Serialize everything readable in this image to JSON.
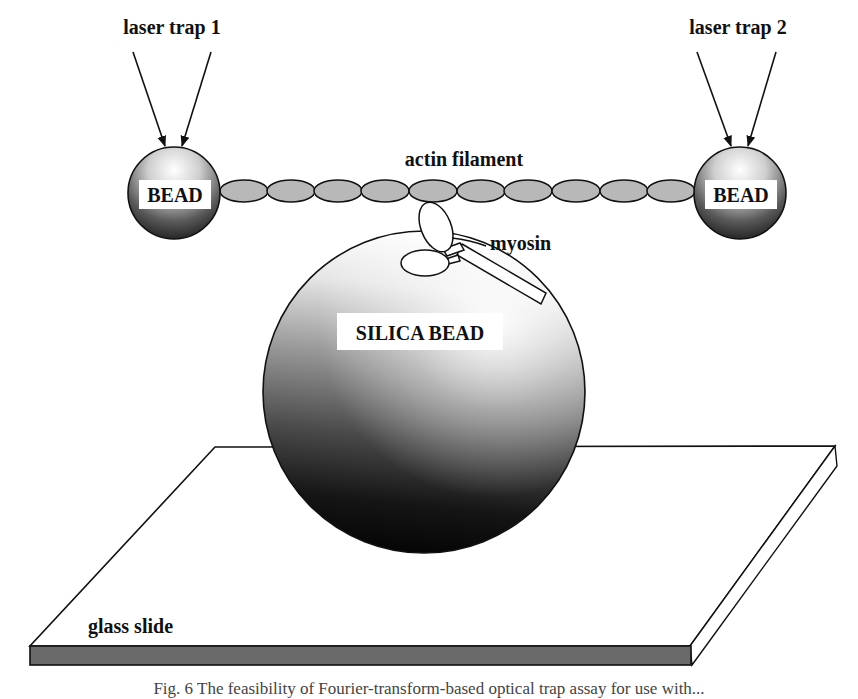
{
  "figure": {
    "labels": {
      "laser_trap_1": "laser trap 1",
      "laser_trap_2": "laser trap 2",
      "actin_filament": "actin filament",
      "myosin": "myosin",
      "bead_left": "BEAD",
      "bead_right": "BEAD",
      "silica_bead": "SILICA BEAD",
      "glass_slide": "glass slide"
    },
    "caption": "Fig. 6 The feasibility of Fourier-transform-based optical trap assay for use with...",
    "colors": {
      "outline": "#111111",
      "actin_fill": "#b8b8b8",
      "slide_edge": "#6a6a6a",
      "background": "#ffffff"
    },
    "actin_subunit_count": 10
  }
}
